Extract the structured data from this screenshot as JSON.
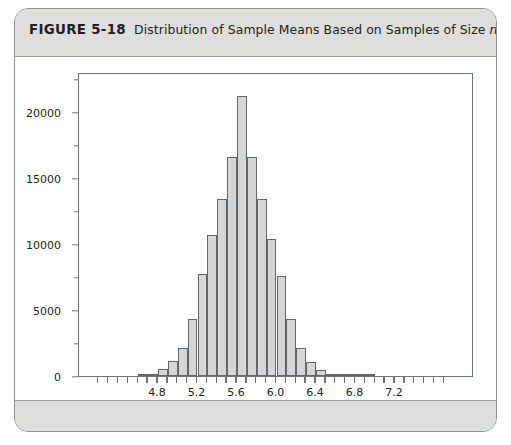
{
  "figure": {
    "number_label": "FIGURE 5-18",
    "caption_part1": "Distribution of Sample Means Based on Samples of Size ",
    "caption_variable": "n",
    "caption_part2": " = 20"
  },
  "chart_data": {
    "type": "bar",
    "title": "Distribution of Sample Means Based on Samples of Size n = 20",
    "xlabel": "",
    "ylabel": "",
    "grid": false,
    "legend": null,
    "xlim": [
      4.0,
      8.0
    ],
    "ylim": [
      0,
      23000
    ],
    "bin_width": 0.1,
    "x_tick_labels": [
      "4.8",
      "5.2",
      "5.6",
      "6.0",
      "6.4",
      "6.8",
      "7.2"
    ],
    "x_tick_values": [
      4.8,
      5.2,
      5.6,
      6.0,
      6.4,
      6.8,
      7.2
    ],
    "x_minor_tick_values": [
      4.2,
      4.3,
      4.4,
      4.5,
      4.6,
      4.7,
      4.9,
      5.0,
      5.1,
      5.3,
      5.4,
      5.5,
      5.7,
      5.8,
      5.9,
      6.1,
      6.2,
      6.3,
      6.5,
      6.6,
      6.7,
      6.9,
      7.0,
      7.1,
      7.3,
      7.4,
      7.5,
      7.6,
      7.7
    ],
    "y_tick_labels": [
      "0",
      "5000",
      "10000",
      "15000",
      "20000"
    ],
    "y_tick_values": [
      0,
      5000,
      10000,
      15000,
      20000
    ],
    "y_minor_tick_values": [
      2500,
      7500,
      12500,
      17500,
      22500
    ],
    "categories": [
      4.65,
      4.75,
      4.85,
      4.95,
      5.05,
      5.15,
      5.25,
      5.35,
      5.45,
      5.55,
      5.65,
      5.75,
      5.85,
      5.95,
      6.05,
      6.15,
      6.25,
      6.35,
      6.45,
      6.55,
      6.65,
      6.75,
      6.85,
      6.95
    ],
    "values": [
      60,
      180,
      520,
      1150,
      2150,
      4300,
      7700,
      10700,
      13400,
      16600,
      21200,
      16600,
      13400,
      10400,
      7600,
      4300,
      2150,
      1050,
      480,
      160,
      60,
      20,
      10,
      5
    ],
    "bar_fill_color": "#d6d6d6",
    "bar_edge_color": "#636769",
    "axis_color": "#6f7477",
    "plot_background": "#ffffff"
  },
  "style": {
    "card_border_color": "#8d9396",
    "band_background": "#dededd",
    "band_border_color": "#9aa0a2",
    "text_color": "#231f20"
  }
}
